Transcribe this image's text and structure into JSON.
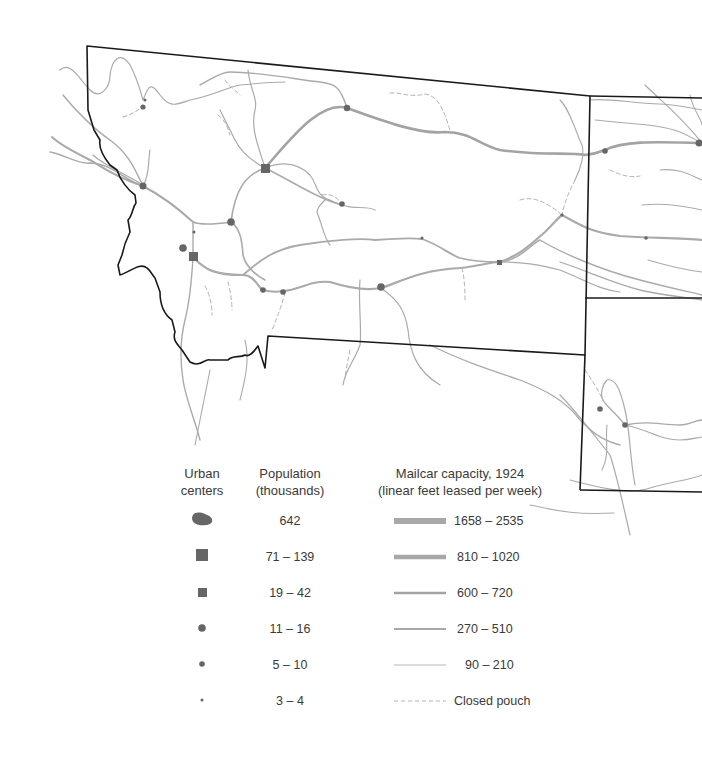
{
  "map": {
    "colors": {
      "border": "#1a1a1a",
      "route": "#a9a9a9",
      "route_dark": "#9a9a9a",
      "city": "#666666"
    }
  },
  "legend": {
    "urban": {
      "header_line1": "Urban",
      "header_line2": "centers"
    },
    "population": {
      "header_line1": "Population",
      "header_line2": "(thousands)",
      "items": [
        {
          "symbol": "urban-area",
          "label": "642"
        },
        {
          "symbol": "large-square",
          "label": "71 – 139"
        },
        {
          "symbol": "small-square",
          "label": "19 – 42"
        },
        {
          "symbol": "large-dot",
          "label": "11 – 16"
        },
        {
          "symbol": "medium-dot",
          "label": "5 – 10"
        },
        {
          "symbol": "small-dot",
          "label": "3 – 4"
        }
      ]
    },
    "mailcar": {
      "header_line1": "Mailcar capacity, 1924",
      "header_line2": "(linear feet leased per week)",
      "items": [
        {
          "width": 7,
          "label": "1658 – 2535"
        },
        {
          "width": 5,
          "label": "810 – 1020"
        },
        {
          "width": 3,
          "label": "600 – 720"
        },
        {
          "width": 2,
          "label": "270 – 510"
        },
        {
          "width": 1.2,
          "label": "90 – 210"
        },
        {
          "width": 1,
          "dashed": true,
          "label": "Closed pouch"
        }
      ]
    }
  }
}
